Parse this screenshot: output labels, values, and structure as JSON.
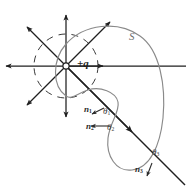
{
  "figure": {
    "background_color": "#ffffff",
    "field_line_color": "#262626",
    "surface_color": "#8a8a8a",
    "dashed_circle_color": "#3a3a3a",
    "axis_line_color": "#1f1f1f",
    "charge_label": "+q",
    "surface_label": "S",
    "normals": [
      {
        "label": "n",
        "subscript": "1"
      },
      {
        "label": "n",
        "subscript": "2"
      },
      {
        "label": "n",
        "subscript": "3"
      }
    ],
    "angles": [
      {
        "label": "θ",
        "subscript": "1"
      },
      {
        "label": "θ",
        "subscript": "2"
      },
      {
        "label": "θ",
        "subscript": "3"
      }
    ],
    "center_marker": "open-circle",
    "field_line_count": 8,
    "geometry": {
      "center_x": 66,
      "center_y": 66,
      "dashed_radius": 32
    }
  }
}
